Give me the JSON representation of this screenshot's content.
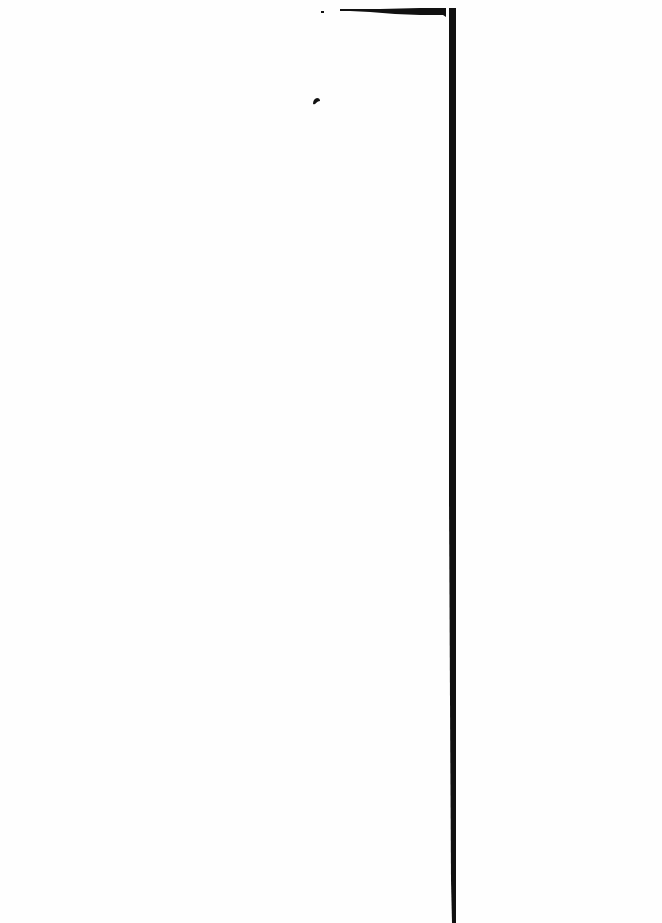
{
  "document": {
    "type": "scanned-page",
    "text_content": "",
    "background_color": "#fefefe",
    "ink_color": "#111111",
    "marks": [
      {
        "name": "vertical-rule",
        "description": "dark vertical line / page edge"
      },
      {
        "name": "top-horizontal-stroke",
        "description": "tapered horizontal stroke at the top"
      },
      {
        "name": "top-dash",
        "description": "small dash at top"
      },
      {
        "name": "ink-blot",
        "description": "small ink smudge"
      }
    ]
  }
}
